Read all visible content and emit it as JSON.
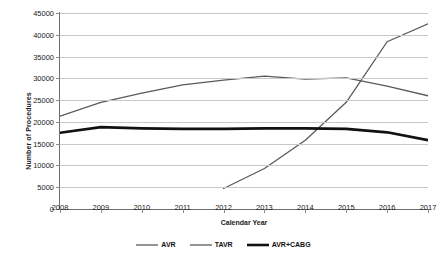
{
  "chart_data": {
    "type": "line",
    "title": "",
    "xlabel": "Calendar Year",
    "ylabel": "Number of Procedures",
    "x": [
      2008,
      2009,
      2010,
      2011,
      2012,
      2013,
      2014,
      2015,
      2016,
      2017
    ],
    "categories": [
      "2008",
      "2009",
      "2010",
      "2011",
      "2012",
      "2013",
      "2014",
      "2015",
      "2016",
      "2017"
    ],
    "xlim": [
      2008,
      2017
    ],
    "ylim": [
      0,
      45000
    ],
    "ytick_values": [
      0,
      5000,
      10000,
      15000,
      20000,
      25000,
      30000,
      35000,
      40000,
      45000
    ],
    "ytick_labels": [
      "0",
      "5000",
      "10000",
      "15000",
      "20000",
      "25000",
      "30000",
      "35000",
      "40000",
      "45000"
    ],
    "grid": true,
    "legend_position": "bottom",
    "series": [
      {
        "name": "AVR",
        "color": "#5a5a5a",
        "width": 1.3,
        "values": [
          21300,
          24500,
          26600,
          28500,
          29600,
          30500,
          29800,
          30100,
          28200,
          26000
        ]
      },
      {
        "name": "TAVR",
        "color": "#5a5a5a",
        "width": 1.3,
        "values": [
          null,
          null,
          null,
          null,
          4700,
          9300,
          15800,
          24500,
          38400,
          42500
        ]
      },
      {
        "name": "AVR+CABG",
        "color": "#111111",
        "width": 2.6,
        "values": [
          17500,
          18800,
          18500,
          18400,
          18400,
          18500,
          18500,
          18400,
          17600,
          15800
        ]
      }
    ]
  },
  "legend": {
    "items": [
      {
        "label": "AVR"
      },
      {
        "label": "TAVR"
      },
      {
        "label": "AVR+CABG"
      }
    ]
  }
}
